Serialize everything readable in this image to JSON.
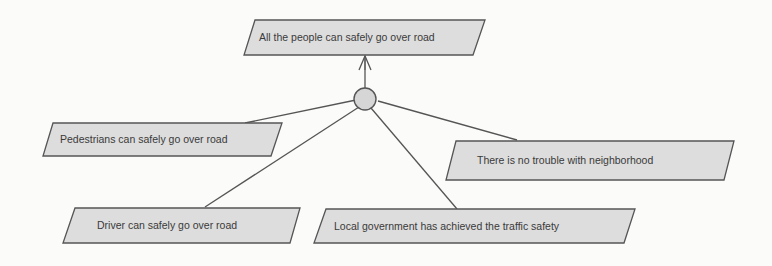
{
  "diagram": {
    "type": "goal-decomposition",
    "root": {
      "id": "goal-root",
      "label": "All the people can safely go over road"
    },
    "junction": {
      "kind": "and-decomposition-circle"
    },
    "children": [
      {
        "id": "goal-pedestrians",
        "label": "Pedestrians can safely go over road"
      },
      {
        "id": "goal-driver",
        "label": "Driver can safely go over road"
      },
      {
        "id": "goal-government",
        "label": "Local government has achieved the traffic safety"
      },
      {
        "id": "goal-neighborhood",
        "label": "There is no trouble with neighborhood"
      }
    ],
    "colors": {
      "node_fill": "#dddddd",
      "node_stroke": "#555555",
      "edge": "#555555",
      "junction_fill": "#d6d6d6",
      "text": "#3a3a3a",
      "background": "#fbfbfa"
    }
  }
}
